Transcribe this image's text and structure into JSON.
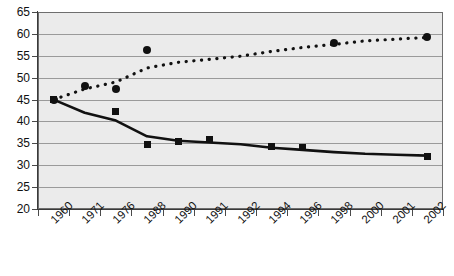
{
  "chart_data": {
    "type": "scatter",
    "title": "",
    "subtitle": "",
    "xlabel": "",
    "ylabel": "",
    "xlim": [
      0,
      12
    ],
    "ylim": [
      20,
      65
    ],
    "ytick_step": 5,
    "grid": true,
    "legend": "none",
    "categories": [
      "1960",
      "1971",
      "1976",
      "1988",
      "1990",
      "1991",
      "1992",
      "1994",
      "1996",
      "1998",
      "2000",
      "2001",
      "2002"
    ],
    "yticks": [
      "20",
      "25",
      "30",
      "35",
      "40",
      "45",
      "50",
      "55",
      "60",
      "65"
    ],
    "series": [
      {
        "name": "declining-series",
        "marker": "square",
        "trendline": "solid",
        "color": "#111111",
        "points": [
          {
            "x": "1960",
            "y": 45.0
          },
          {
            "x": "1976",
            "y": 42.3
          },
          {
            "x": "1988",
            "y": 34.8
          },
          {
            "x": "1990",
            "y": 35.5
          },
          {
            "x": "1991",
            "y": 35.8
          },
          {
            "x": "1994",
            "y": 34.3
          },
          {
            "x": "1996",
            "y": 34.1
          },
          {
            "x": "2002",
            "y": 32.0
          }
        ],
        "trend_values": [
          45.0,
          42.0,
          40.2,
          36.6,
          35.6,
          35.2,
          34.8,
          34.0,
          33.5,
          33.0,
          32.6,
          32.4,
          32.2
        ]
      },
      {
        "name": "rising-series",
        "marker": "circle",
        "trendline": "dotted",
        "color": "#111111",
        "points": [
          {
            "x": "1960",
            "y": 45.0
          },
          {
            "x": "1971",
            "y": 48.2
          },
          {
            "x": "1976",
            "y": 47.3
          },
          {
            "x": "1988",
            "y": 56.3
          },
          {
            "x": "1998",
            "y": 58.0
          },
          {
            "x": "2002",
            "y": 59.3
          }
        ],
        "trend_values": [
          45.0,
          47.4,
          49.0,
          52.2,
          53.5,
          54.2,
          54.9,
          56.0,
          56.9,
          57.6,
          58.4,
          58.8,
          59.2
        ]
      }
    ]
  }
}
